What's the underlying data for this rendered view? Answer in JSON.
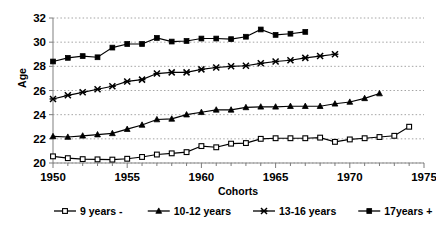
{
  "chart_data": {
    "type": "line",
    "title": "",
    "xlabel": "Cohorts",
    "ylabel": "Age",
    "xlim": [
      1950,
      1975
    ],
    "ylim": [
      20,
      32
    ],
    "xticks": [
      1950,
      1955,
      1960,
      1965,
      1970,
      1975
    ],
    "yticks": [
      20,
      22,
      24,
      26,
      28,
      30,
      32
    ],
    "xtick_labels": [
      "1950",
      "1955",
      "1960",
      "1965",
      "1970",
      "1975"
    ],
    "ytick_labels": [
      "20",
      "22",
      "24",
      "26",
      "28",
      "30",
      "32"
    ],
    "grid": "horizontal-dotted",
    "legend_position": "bottom",
    "series": [
      {
        "name": "9 years -",
        "marker": "square-open",
        "x": [
          1950,
          1951,
          1952,
          1953,
          1954,
          1955,
          1956,
          1957,
          1958,
          1959,
          1960,
          1961,
          1962,
          1963,
          1964,
          1965,
          1966,
          1967,
          1968,
          1969,
          1970,
          1971,
          1972,
          1973,
          1974
        ],
        "values": [
          20.55,
          20.4,
          20.32,
          20.3,
          20.28,
          20.35,
          20.5,
          20.7,
          20.8,
          20.9,
          21.4,
          21.3,
          21.6,
          21.65,
          22.0,
          22.05,
          22.05,
          22.05,
          22.1,
          21.75,
          21.95,
          22.05,
          22.15,
          22.25,
          23.0
        ]
      },
      {
        "name": "10-12 years",
        "marker": "triangle",
        "x": [
          1950,
          1951,
          1952,
          1953,
          1954,
          1955,
          1956,
          1957,
          1958,
          1959,
          1960,
          1961,
          1962,
          1963,
          1964,
          1965,
          1966,
          1967,
          1968,
          1969,
          1970,
          1971,
          1972
        ],
        "values": [
          22.2,
          22.15,
          22.25,
          22.35,
          22.45,
          22.8,
          23.15,
          23.6,
          23.65,
          24.0,
          24.2,
          24.4,
          24.4,
          24.6,
          24.65,
          24.65,
          24.7,
          24.7,
          24.7,
          24.9,
          25.05,
          25.35,
          25.75
        ]
      },
      {
        "name": "13-16 years",
        "marker": "cross-x",
        "x": [
          1950,
          1951,
          1952,
          1953,
          1954,
          1955,
          1956,
          1957,
          1958,
          1959,
          1960,
          1961,
          1962,
          1963,
          1964,
          1965,
          1966,
          1967,
          1968,
          1969
        ],
        "values": [
          25.3,
          25.6,
          25.85,
          26.1,
          26.35,
          26.75,
          26.9,
          27.4,
          27.5,
          27.5,
          27.75,
          27.9,
          28.0,
          28.05,
          28.25,
          28.4,
          28.5,
          28.7,
          28.85,
          29.0
        ]
      },
      {
        "name": "17years +",
        "marker": "square-filled",
        "x": [
          1950,
          1951,
          1952,
          1953,
          1954,
          1955,
          1956,
          1957,
          1958,
          1959,
          1960,
          1961,
          1962,
          1963,
          1964,
          1965,
          1966,
          1967
        ],
        "values": [
          28.4,
          28.7,
          28.85,
          28.75,
          29.55,
          29.85,
          29.85,
          30.35,
          30.05,
          30.1,
          30.3,
          30.3,
          30.25,
          30.45,
          31.05,
          30.6,
          30.7,
          30.85
        ]
      }
    ]
  },
  "legend": {
    "items": [
      {
        "label": "9 years -",
        "marker": "square-open"
      },
      {
        "label": "10-12 years",
        "marker": "triangle"
      },
      {
        "label": "13-16 years",
        "marker": "cross-x"
      },
      {
        "label": "17years +",
        "marker": "square-filled"
      }
    ]
  }
}
